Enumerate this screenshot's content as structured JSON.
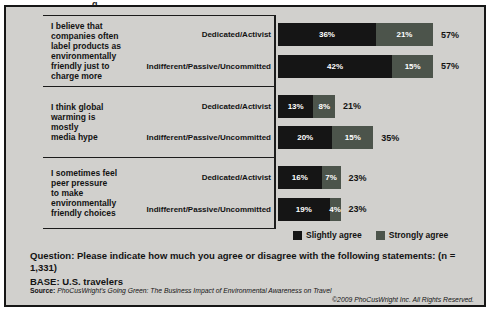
{
  "artifact": {
    "top_crop_text": "g"
  },
  "chart_data": {
    "type": "bar",
    "stacked": true,
    "orientation": "horizontal",
    "value_unit": "%",
    "xlim": [
      0,
      60
    ],
    "series_names": [
      "Slightly agree",
      "Strongly agree"
    ],
    "colors": {
      "slightly_agree": "#151515",
      "strongly_agree": "#4c544b"
    },
    "groups": [
      {
        "statement_lines": [
          "I believe that",
          "companies often",
          "label products as",
          "environmentally",
          "friendly just to",
          "charge more"
        ],
        "rows": [
          {
            "label": "Dedicated/Activist",
            "slightly_agree": 36,
            "strongly_agree": 21,
            "total": 57
          },
          {
            "label": "Indifferent/Passive/Uncommitted",
            "slightly_agree": 42,
            "strongly_agree": 15,
            "total": 57
          }
        ]
      },
      {
        "statement_lines": [
          "I think global",
          "warming is",
          "mostly",
          "media hype"
        ],
        "rows": [
          {
            "label": "Dedicated/Activist",
            "slightly_agree": 13,
            "strongly_agree": 8,
            "total": 21
          },
          {
            "label": "Indifferent/Passive/Uncommitted",
            "slightly_agree": 20,
            "strongly_agree": 15,
            "total": 35
          }
        ]
      },
      {
        "statement_lines": [
          "I sometimes feel",
          "peer pressure",
          "to make",
          "environmentally",
          "friendly choices"
        ],
        "rows": [
          {
            "label": "Dedicated/Activist",
            "slightly_agree": 16,
            "strongly_agree": 7,
            "total": 23
          },
          {
            "label": "Indifferent/Passive/Uncommitted",
            "slightly_agree": 19,
            "strongly_agree": 4,
            "total": 23
          }
        ]
      }
    ],
    "legend": [
      {
        "label": "Slightly agree",
        "color": "#151515"
      },
      {
        "label": "Strongly agree",
        "color": "#4c544b"
      }
    ],
    "legend_position": "bottom-right"
  },
  "footer": {
    "question_label": "Question:",
    "question_text": "Please indicate how much you agree or disagree with the following statements: (n = 1,331)",
    "base_text": "BASE: U.S. travelers",
    "source_label": "Source:",
    "source_text": "PhoCusWright's Going Green: The Business Impact of Environmental Awareness on Travel",
    "copyright": "©2009 PhoCusWright Inc. All Rights Reserved."
  }
}
